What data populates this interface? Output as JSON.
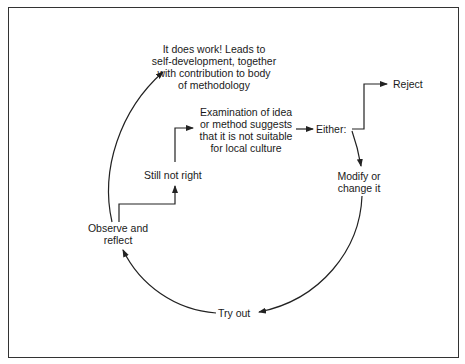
{
  "diagram": {
    "nodes": {
      "it_works": {
        "lines": [
          "It does work! Leads to",
          "self-development, together",
          "with contribution to body",
          "of methodology"
        ]
      },
      "examination": {
        "lines": [
          "Examination of idea",
          "or method suggests",
          "that it is not suitable",
          "for local culture"
        ]
      },
      "either": {
        "text": "Either:"
      },
      "reject": {
        "text": "Reject"
      },
      "modify": {
        "lines": [
          "Modify or",
          "change it"
        ]
      },
      "try_out": {
        "text": "Try out"
      },
      "observe": {
        "lines": [
          "Observe and",
          "reflect"
        ]
      },
      "still_not_right": {
        "text": "Still not right"
      }
    },
    "edges": [
      {
        "from": "examination",
        "to": "either"
      },
      {
        "from": "either",
        "to": "reject"
      },
      {
        "from": "either",
        "to": "modify"
      },
      {
        "from": "modify",
        "to": "try_out"
      },
      {
        "from": "try_out",
        "to": "observe"
      },
      {
        "from": "observe",
        "to": "still_not_right"
      },
      {
        "from": "still_not_right",
        "to": "examination"
      },
      {
        "from": "observe",
        "to": "it_works"
      }
    ],
    "colors": {
      "line": "#222222",
      "text": "#1a1a1a",
      "background": "#ffffff"
    }
  }
}
